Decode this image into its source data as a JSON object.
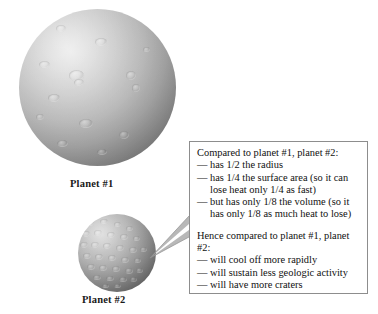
{
  "figure": {
    "background_color": "#ffffff",
    "planets": [
      {
        "id": "planet-1",
        "label": "Planet #1",
        "relative_size": "large",
        "surface": "smooth with few large craters"
      },
      {
        "id": "planet-2",
        "label": "Planet #2",
        "relative_size": "small",
        "surface": "heavily cratered"
      }
    ]
  },
  "callout": {
    "border_color": "#8d8d8d",
    "background_color": "#ffffff",
    "paragraphs": [
      {
        "lead": "Compared to planet #1, planet #2:",
        "bullets": [
          "— has 1/2 the radius",
          "— has 1/4 the surface area (so it can lose heat only 1/4 as fast)",
          "— but has only 1/8 the volume (so it has only 1/8 as much heat to lose)"
        ]
      },
      {
        "lead": "Hence compared to planet #1, planet #2:",
        "bullets": [
          "— will cool off more rapidly",
          "— will sustain less geologic activity",
          "— will have more craters"
        ]
      }
    ]
  },
  "leader_lines": {
    "color": "#9a9a9a",
    "description": "thin wedge from planet #2 to left edge of callout box"
  },
  "craters_planet1": [
    {
      "x": 37,
      "y": 16,
      "w": 10,
      "h": 7
    },
    {
      "x": 76,
      "y": 29,
      "w": 12,
      "h": 8
    },
    {
      "x": 20,
      "y": 52,
      "w": 11,
      "h": 7
    },
    {
      "x": 50,
      "y": 61,
      "w": 15,
      "h": 11
    },
    {
      "x": 55,
      "y": 70,
      "w": 10,
      "h": 7
    },
    {
      "x": 107,
      "y": 62,
      "w": 10,
      "h": 9
    },
    {
      "x": 29,
      "y": 85,
      "w": 12,
      "h": 8
    },
    {
      "x": 113,
      "y": 75,
      "w": 8,
      "h": 8
    },
    {
      "x": 60,
      "y": 110,
      "w": 14,
      "h": 9
    },
    {
      "x": 100,
      "y": 122,
      "w": 10,
      "h": 8
    },
    {
      "x": 38,
      "y": 131,
      "w": 11,
      "h": 7
    },
    {
      "x": 78,
      "y": 140,
      "w": 10,
      "h": 6
    },
    {
      "x": 124,
      "y": 38,
      "w": 7,
      "h": 5
    },
    {
      "x": 17,
      "y": 105,
      "w": 8,
      "h": 6
    }
  ],
  "craters_planet2": [
    {
      "x": 9,
      "y": 7,
      "w": 7,
      "h": 5
    },
    {
      "x": 22,
      "y": 5,
      "w": 8,
      "h": 5
    },
    {
      "x": 36,
      "y": 8,
      "w": 7,
      "h": 5
    },
    {
      "x": 48,
      "y": 12,
      "w": 7,
      "h": 5
    },
    {
      "x": 4,
      "y": 17,
      "w": 8,
      "h": 6
    },
    {
      "x": 16,
      "y": 16,
      "w": 8,
      "h": 6
    },
    {
      "x": 29,
      "y": 18,
      "w": 8,
      "h": 6
    },
    {
      "x": 42,
      "y": 20,
      "w": 8,
      "h": 6
    },
    {
      "x": 55,
      "y": 22,
      "w": 7,
      "h": 5
    },
    {
      "x": 2,
      "y": 28,
      "w": 8,
      "h": 6
    },
    {
      "x": 13,
      "y": 28,
      "w": 8,
      "h": 6
    },
    {
      "x": 25,
      "y": 29,
      "w": 8,
      "h": 6
    },
    {
      "x": 38,
      "y": 31,
      "w": 8,
      "h": 6
    },
    {
      "x": 51,
      "y": 33,
      "w": 8,
      "h": 6
    },
    {
      "x": 62,
      "y": 33,
      "w": 7,
      "h": 5
    },
    {
      "x": 5,
      "y": 39,
      "w": 8,
      "h": 6
    },
    {
      "x": 17,
      "y": 40,
      "w": 8,
      "h": 6
    },
    {
      "x": 30,
      "y": 41,
      "w": 8,
      "h": 6
    },
    {
      "x": 43,
      "y": 43,
      "w": 8,
      "h": 6
    },
    {
      "x": 56,
      "y": 44,
      "w": 7,
      "h": 5
    },
    {
      "x": 9,
      "y": 50,
      "w": 8,
      "h": 6
    },
    {
      "x": 21,
      "y": 51,
      "w": 8,
      "h": 6
    },
    {
      "x": 34,
      "y": 52,
      "w": 8,
      "h": 6
    },
    {
      "x": 47,
      "y": 54,
      "w": 8,
      "h": 6
    },
    {
      "x": 58,
      "y": 54,
      "w": 7,
      "h": 5
    },
    {
      "x": 15,
      "y": 61,
      "w": 8,
      "h": 5
    },
    {
      "x": 28,
      "y": 62,
      "w": 8,
      "h": 5
    },
    {
      "x": 41,
      "y": 63,
      "w": 8,
      "h": 5
    },
    {
      "x": 52,
      "y": 63,
      "w": 7,
      "h": 5
    },
    {
      "x": 24,
      "y": 70,
      "w": 7,
      "h": 4
    },
    {
      "x": 36,
      "y": 70,
      "w": 7,
      "h": 4
    }
  ]
}
